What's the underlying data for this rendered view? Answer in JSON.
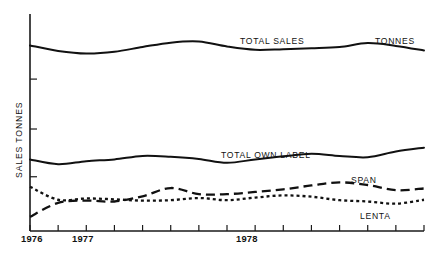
{
  "chart_data": {
    "type": "line",
    "title": "",
    "xlabel": "",
    "ylabel": "SALES TONNES",
    "unit_note": "TONNES",
    "grid": false,
    "legend_position": "inline-annotations",
    "x_tick_labels": [
      "1976",
      "1977",
      "1978"
    ],
    "x_tick_label_positions": [
      0,
      4,
      10
    ],
    "x_tick_count": 15,
    "xlim": [
      0,
      14
    ],
    "ylim": [
      0,
      100
    ],
    "y_tick_values": [
      25,
      47,
      70
    ],
    "series": [
      {
        "name": "TOTAL SALES",
        "style": "solid",
        "x": [
          0,
          1,
          2,
          3,
          4,
          5,
          6,
          7,
          8,
          9,
          10,
          11,
          12,
          13,
          14
        ],
        "values": [
          85.5,
          83.0,
          81.8,
          82.6,
          84.8,
          86.8,
          87.3,
          85.0,
          83.5,
          83.8,
          84.2,
          84.8,
          86.6,
          85.3,
          83.2
        ]
      },
      {
        "name": "TOTAL OWN LABEL",
        "style": "solid",
        "x": [
          0,
          1,
          2,
          3,
          4,
          5,
          6,
          7,
          8,
          9,
          10,
          11,
          12,
          13,
          14
        ],
        "values": [
          33.0,
          30.8,
          32.2,
          33.0,
          34.6,
          34.2,
          33.2,
          31.4,
          33.0,
          34.4,
          35.6,
          34.6,
          34.0,
          36.6,
          38.4
        ]
      },
      {
        "name": "SPAN",
        "style": "dashed",
        "x": [
          0,
          1,
          2,
          3,
          4,
          5,
          6,
          7,
          8,
          9,
          10,
          11,
          12,
          13,
          14
        ],
        "values": [
          6.5,
          13.0,
          14.0,
          13.6,
          16.0,
          19.8,
          17.0,
          17.0,
          18.0,
          19.2,
          21.0,
          22.4,
          21.2,
          18.8,
          19.6
        ]
      },
      {
        "name": "LENTA",
        "style": "dotted",
        "x": [
          0,
          1,
          2,
          3,
          4,
          5,
          6,
          7,
          8,
          9,
          10,
          11,
          12,
          13,
          14
        ],
        "values": [
          20.4,
          14.4,
          15.0,
          14.6,
          14.0,
          14.2,
          15.2,
          14.2,
          15.4,
          16.4,
          15.8,
          14.2,
          13.6,
          12.6,
          14.4
        ]
      }
    ],
    "annotations": [
      {
        "text": "TOTAL SALES",
        "name": "total-sales-label"
      },
      {
        "text": "TONNES",
        "name": "tonnes-label"
      },
      {
        "text": "TOTAL OWN LABEL",
        "name": "total-own-label-label"
      },
      {
        "text": "SPAN",
        "name": "span-label"
      },
      {
        "text": "LENTA",
        "name": "lenta-label"
      }
    ],
    "colors": {
      "ink": "#111111",
      "background": "#ffffff"
    }
  }
}
